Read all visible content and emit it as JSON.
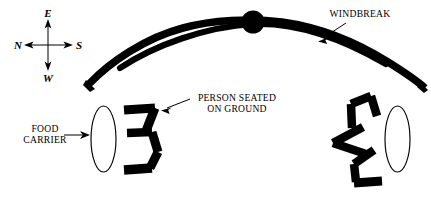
{
  "figure": {
    "background_color": "#ffffff",
    "ink_color": "#000000",
    "width": 431,
    "height": 202
  },
  "compass": {
    "name": "compass-rose",
    "north_label": "N",
    "east_label": "E",
    "south_label": "S",
    "west_label": "W",
    "orientation_note": "E up, N left, S right, W down"
  },
  "labels": {
    "windbreak": "WINDBREAK",
    "person_seated_line1": "PERSON SEATED",
    "person_seated_line2": "ON GROUND",
    "food_carrier_line1": "FOOD",
    "food_carrier_line2": "CARRIER"
  },
  "elements": {
    "windbreak_arc": "windbreak-arc",
    "center_post": "center-post-dot",
    "left_food_carrier": "food-carrier-left",
    "right_food_carrier": "food-carrier-right",
    "person_left": "person-seated-left",
    "person_right_upper": "person-seated-right-upper",
    "person_right_middle": "person-seated-right-middle",
    "person_right_lower": "person-seated-right-lower"
  }
}
